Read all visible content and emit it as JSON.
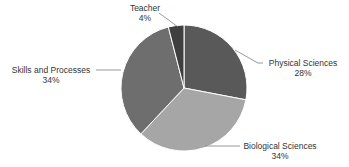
{
  "chart_data": {
    "type": "pie",
    "title": "",
    "start_angle_deg": 0,
    "direction": "clockwise",
    "categories": [
      "Physical Sciences",
      "Biological Sciences",
      "Skills and Processes",
      "Teacher"
    ],
    "values": [
      28,
      34,
      34,
      4
    ],
    "value_labels": [
      "28%",
      "34%",
      "34%",
      "4%"
    ],
    "colors": [
      "#595959",
      "#a6a6a6",
      "#6e6e6e",
      "#3f3f3f"
    ],
    "legend": "none",
    "data_labels": "category name and percentage, outside with leader lines"
  },
  "labels": {
    "physical": {
      "name": "Physical Sciences",
      "pct": "28%"
    },
    "biological": {
      "name": "Biological Sciences",
      "pct": "34%"
    },
    "skills": {
      "name": "Skills and Processes",
      "pct": "34%"
    },
    "teacher": {
      "name": "Teacher",
      "pct": "4%"
    }
  }
}
